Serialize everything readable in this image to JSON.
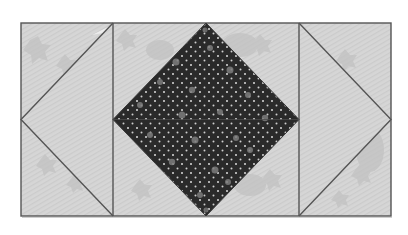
{
  "image": {
    "width": 408,
    "height": 235,
    "background": "#ffffff"
  },
  "quilt_block": {
    "description": "Square-in-a-square quilt block with flying-geese side panels",
    "bounds": {
      "x1": 21,
      "y1": 23,
      "x2": 391,
      "y2": 216
    },
    "panels": [
      {
        "name": "left-panel",
        "x1": 21,
        "x2": 113
      },
      {
        "name": "center-panel",
        "x1": 113,
        "x2": 299
      },
      {
        "name": "right-panel",
        "x1": 299,
        "x2": 391
      }
    ],
    "colors": {
      "light_fabric": "#d4d4d4",
      "light_fabric_alt": "#c9c9c9",
      "star_motif": "#bdbdbd",
      "dark_fabric": "#2a2a2a",
      "dot_small": "#e6e6e6",
      "dot_large": "#8a8a8a",
      "seam": "#555555"
    },
    "fabrics": {
      "light": "light gray star print",
      "dark": "dark polka dot print"
    }
  }
}
